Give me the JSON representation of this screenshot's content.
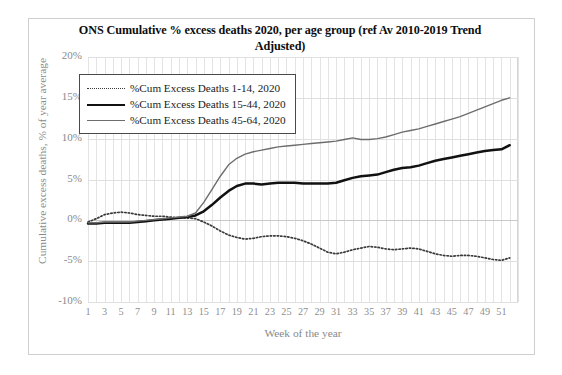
{
  "chart_data": {
    "type": "line",
    "title": "ONS Cumulative % excess deaths 2020, per age group (ref Av 2010-2019 Trend Adjusted)",
    "xlabel": "Week of the year",
    "ylabel": "Cumulative excess deaths, % of year average",
    "xlim": [
      1,
      53
    ],
    "ylim": [
      -10,
      20
    ],
    "ytick_labels": [
      "20%",
      "15%",
      "10%",
      "5%",
      "0%",
      "-5%",
      "-10%"
    ],
    "ytick_values": [
      20,
      15,
      10,
      5,
      0,
      -5,
      -10
    ],
    "xtick_labels": [
      "1",
      "3",
      "5",
      "7",
      "9",
      "11",
      "13",
      "15",
      "17",
      "19",
      "21",
      "23",
      "25",
      "27",
      "29",
      "31",
      "33",
      "35",
      "37",
      "39",
      "41",
      "43",
      "45",
      "47",
      "49",
      "51"
    ],
    "xtick_values": [
      1,
      3,
      5,
      7,
      9,
      11,
      13,
      15,
      17,
      19,
      21,
      23,
      25,
      27,
      29,
      31,
      33,
      35,
      37,
      39,
      41,
      43,
      45,
      47,
      49,
      51
    ],
    "grid": true,
    "legend_position": "upper-left",
    "x": [
      1,
      2,
      3,
      4,
      5,
      6,
      7,
      8,
      9,
      10,
      11,
      12,
      13,
      14,
      15,
      16,
      17,
      18,
      19,
      20,
      21,
      22,
      23,
      24,
      25,
      26,
      27,
      28,
      29,
      30,
      31,
      32,
      33,
      34,
      35,
      36,
      37,
      38,
      39,
      40,
      41,
      42,
      43,
      44,
      45,
      46,
      47,
      48,
      49,
      50,
      51,
      52
    ],
    "series": [
      {
        "name": "%Cum Excess Deaths 1-14, 2020",
        "style": "dotted",
        "color": "#3a3a3a",
        "values": [
          -0.2,
          0.2,
          0.7,
          0.9,
          1.0,
          0.9,
          0.7,
          0.6,
          0.5,
          0.5,
          0.4,
          0.3,
          0.3,
          0.2,
          -0.2,
          -0.7,
          -1.3,
          -1.8,
          -2.1,
          -2.3,
          -2.2,
          -2.0,
          -1.9,
          -1.9,
          -2.0,
          -2.2,
          -2.5,
          -2.9,
          -3.4,
          -3.9,
          -4.1,
          -3.9,
          -3.6,
          -3.4,
          -3.2,
          -3.3,
          -3.5,
          -3.6,
          -3.5,
          -3.4,
          -3.5,
          -3.8,
          -4.1,
          -4.3,
          -4.4,
          -4.3,
          -4.3,
          -4.4,
          -4.6,
          -4.8,
          -4.9,
          -4.6
        ]
      },
      {
        "name": "%Cum Excess Deaths 15-44, 2020",
        "style": "solid-thick",
        "color": "#111111",
        "values": [
          -0.4,
          -0.4,
          -0.3,
          -0.3,
          -0.3,
          -0.3,
          -0.2,
          -0.1,
          0.0,
          0.1,
          0.2,
          0.3,
          0.4,
          0.6,
          1.1,
          1.9,
          2.8,
          3.6,
          4.2,
          4.5,
          4.5,
          4.4,
          4.5,
          4.6,
          4.6,
          4.6,
          4.5,
          4.5,
          4.5,
          4.5,
          4.6,
          4.9,
          5.2,
          5.4,
          5.5,
          5.6,
          5.9,
          6.2,
          6.4,
          6.5,
          6.7,
          7.0,
          7.3,
          7.5,
          7.7,
          7.9,
          8.1,
          8.3,
          8.5,
          8.6,
          8.7,
          9.2
        ]
      },
      {
        "name": "%Cum Excess Deaths 45-64, 2020",
        "style": "solid-thin",
        "color": "#6d6d6d",
        "values": [
          -0.3,
          -0.3,
          -0.2,
          -0.2,
          -0.2,
          -0.2,
          -0.1,
          0.0,
          0.1,
          0.2,
          0.3,
          0.4,
          0.5,
          0.9,
          2.2,
          3.8,
          5.4,
          6.8,
          7.6,
          8.1,
          8.4,
          8.6,
          8.8,
          9.0,
          9.1,
          9.2,
          9.3,
          9.4,
          9.5,
          9.6,
          9.7,
          9.9,
          10.1,
          9.9,
          9.9,
          10.0,
          10.2,
          10.5,
          10.8,
          11.0,
          11.2,
          11.5,
          11.8,
          12.1,
          12.4,
          12.7,
          13.1,
          13.5,
          13.9,
          14.3,
          14.7,
          15.0
        ]
      }
    ]
  }
}
